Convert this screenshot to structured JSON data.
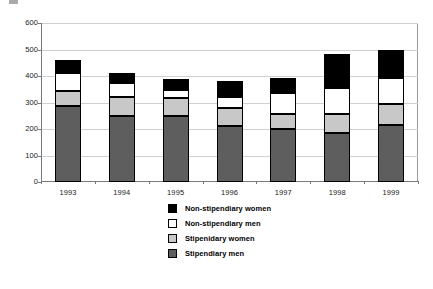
{
  "chart_data": {
    "type": "bar",
    "subtype": "stacked-vertical",
    "title": "",
    "xlabel": "",
    "ylabel": "",
    "ylim": [
      0,
      600
    ],
    "yticks": [
      0,
      100,
      200,
      300,
      400,
      500,
      600
    ],
    "ytick_labels": [
      "0",
      "100",
      "200",
      "300",
      "400",
      "500",
      "600"
    ],
    "grid": true,
    "grid_axis": "y",
    "legend_position": "bottom-center",
    "categories": [
      "1993",
      "1994",
      "1995",
      "1996",
      "1997",
      "1998",
      "1999"
    ],
    "series": [
      {
        "name": "Stipendiary men",
        "color": "#5e5e5e",
        "values": [
          287,
          250,
          250,
          210,
          200,
          185,
          215
        ]
      },
      {
        "name": "Stipenidary women",
        "color": "#c8c8c8",
        "values": [
          58,
          72,
          68,
          68,
          55,
          70,
          78
        ]
      },
      {
        "name": "Non-stipendiary men",
        "color": "#ffffff",
        "values": [
          65,
          50,
          30,
          42,
          80,
          98,
          98
        ]
      },
      {
        "name": "Non-stipendiary women",
        "color": "#000000",
        "values": [
          50,
          38,
          42,
          62,
          57,
          130,
          107
        ]
      }
    ],
    "stack_order_bottom_to_top": [
      "Stipendiary men",
      "Stipenidary women",
      "Non-stipendiary men",
      "Non-stipendiary women"
    ],
    "totals": [
      460,
      410,
      390,
      382,
      392,
      483,
      498
    ]
  },
  "legend": {
    "items": [
      {
        "label": "Non-stipendiary women",
        "swatch": "black-square-swatch",
        "color": "#000000"
      },
      {
        "label": "Non-stipendiary men",
        "swatch": "white-square-swatch",
        "color": "#ffffff"
      },
      {
        "label": "Stipenidary women",
        "swatch": "light-gray-square-swatch",
        "color": "#c8c8c8"
      },
      {
        "label": "Stipendiary men",
        "swatch": "dark-gray-square-swatch",
        "color": "#5e5e5e"
      }
    ]
  },
  "axes": {
    "y_tick_labels": [
      "600",
      "500",
      "400",
      "300",
      "200",
      "100",
      "0"
    ],
    "x_tick_labels": [
      "1993",
      "1994",
      "1995",
      "1996",
      "1997",
      "1998",
      "1999"
    ]
  }
}
